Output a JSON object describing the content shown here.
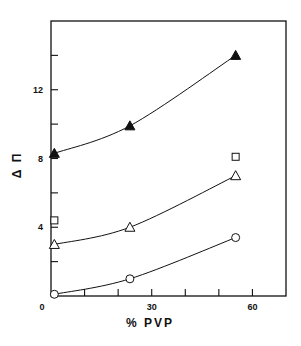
{
  "chart_data": {
    "type": "line",
    "title": "",
    "xlabel": "% PVP",
    "ylabel": "Δ Π",
    "xlim": [
      0,
      70
    ],
    "ylim": [
      0,
      16
    ],
    "x_ticks": [
      0,
      10,
      20,
      30,
      40,
      50,
      60
    ],
    "x_tick_labels": [
      "0",
      "",
      "",
      "30",
      "",
      "",
      "60"
    ],
    "y_ticks": [
      0,
      2,
      4,
      6,
      8,
      10,
      12,
      14
    ],
    "y_tick_labels": [
      "0",
      "",
      "4",
      "",
      "8",
      "",
      "12",
      ""
    ],
    "grid": false,
    "legend": "none",
    "series": [
      {
        "name": "filled-triangle",
        "marker": "filled-triangle",
        "curve": true,
        "x": [
          1,
          23.5,
          55
        ],
        "y": [
          8.3,
          9.9,
          14.0
        ]
      },
      {
        "name": "open-square",
        "marker": "open-square",
        "curve": false,
        "x": [
          1,
          55
        ],
        "y": [
          4.4,
          8.1
        ]
      },
      {
        "name": "open-triangle",
        "marker": "open-triangle",
        "curve": true,
        "x": [
          1,
          23.5,
          55
        ],
        "y": [
          3.0,
          4.0,
          7.0
        ]
      },
      {
        "name": "open-circle",
        "marker": "open-circle",
        "curve": true,
        "x": [
          1,
          23.5,
          55
        ],
        "y": [
          0.1,
          1.0,
          3.4
        ]
      }
    ]
  },
  "colors": {
    "ink": "#111111",
    "background": "#ffffff"
  }
}
